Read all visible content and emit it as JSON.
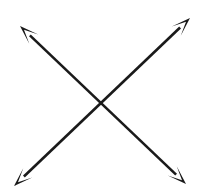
{
  "figure": {
    "background_color": "#ffffff",
    "stroke_color": "#1a1a1a",
    "stroke_width": 2.6,
    "canvas": {
      "width": 198,
      "height": 195
    },
    "crossing_point": {
      "x": 102,
      "y": 106
    },
    "arrowhead": {
      "style": "barbed-concave",
      "length": 19,
      "half_width": 6.5,
      "notch_depth": 5.5
    },
    "arrows": [
      {
        "name": "arrow-nesw",
        "description": "Double-headed arrow running from lower-right to upper-left",
        "double_headed": true,
        "start": {
          "x": 186,
          "y": 184
        },
        "end": {
          "x": 20,
          "y": 26
        },
        "head_at_start": true,
        "head_at_end": true
      },
      {
        "name": "arrow-nwse",
        "description": "Double-headed arrow running from lower-left to upper-right",
        "double_headed": true,
        "start": {
          "x": 14,
          "y": 186
        },
        "end": {
          "x": 190,
          "y": 18
        },
        "head_at_start": true,
        "head_at_end": true
      }
    ]
  }
}
